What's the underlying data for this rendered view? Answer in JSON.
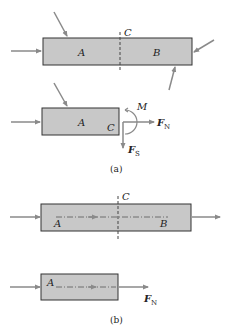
{
  "figure": {
    "colors": {
      "bar_fill": "#c8c8c8",
      "bar_stroke": "#333333",
      "arrow": "#8a8a8a",
      "axis_line": "#555555",
      "text": "#222222"
    },
    "part_a": {
      "top_bar": {
        "label_left": "A",
        "label_right": "B",
        "section_label": "C"
      },
      "free_body": {
        "label_part": "A",
        "label_section": "C",
        "moment": "M",
        "normal_force": "F",
        "normal_force_sub": "N",
        "shear_force": "F",
        "shear_force_sub": "S"
      },
      "caption": "(a)"
    },
    "part_b": {
      "top_bar": {
        "label_left": "A",
        "label_right": "B",
        "section_label": "C"
      },
      "free_body": {
        "label_part": "A",
        "normal_force": "F",
        "normal_force_sub": "N"
      },
      "caption": "(b)"
    }
  }
}
